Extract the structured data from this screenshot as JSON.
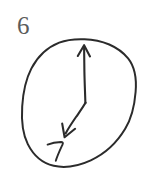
{
  "figure": {
    "kind": "hand-drawn-clock-sketch",
    "width_px": 156,
    "height_px": 174,
    "background_color": "#ffffff",
    "ink_color": "#2b2b2b",
    "label_color": "#5b5b5b"
  },
  "item_index": {
    "text": "6",
    "position": {
      "x": 17,
      "y": 13
    },
    "font_size_px": 25
  },
  "clock": {
    "dial": {
      "center": {
        "x": 79,
        "y": 103.5
      },
      "radius_x": 57,
      "radius_y": 64.5,
      "stroke_width": 2.0,
      "stroke_color": "#2b2b2b",
      "fill": "none",
      "shape": "hand-drawn-ellipse"
    },
    "hands": [
      {
        "name": "long-hand-up",
        "points_to_oclock": 12,
        "direction_degrees": 0,
        "from": {
          "x": 85,
          "y": 103
        },
        "to": {
          "x": 84,
          "y": 46
        },
        "has_arrowhead": true,
        "stroke_width": 2.0
      },
      {
        "name": "short-hand-down-left",
        "points_to_oclock": 7,
        "direction_degrees": 205,
        "from": {
          "x": 85,
          "y": 103
        },
        "to": {
          "x": 65,
          "y": 137
        },
        "has_arrowhead": true,
        "stroke_width": 2.0
      }
    ],
    "hour_marks": [
      {
        "text": "7",
        "position": {
          "x": 48,
          "y": 141
        },
        "font_size_px": 20,
        "style": "hand-written-digit"
      }
    ]
  },
  "reading": {
    "hand_up_target": "12",
    "hand_down_left_target": "7"
  }
}
